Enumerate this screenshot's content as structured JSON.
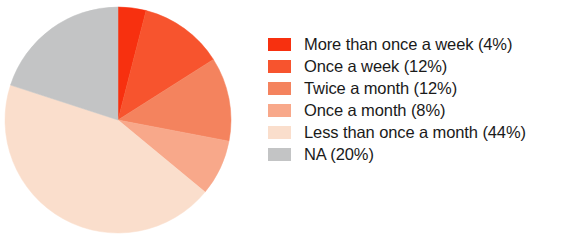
{
  "chart_data": {
    "type": "pie",
    "title": "",
    "subtitle": "",
    "xlabel": "",
    "ylabel": "",
    "legend_position": "right",
    "grid": false,
    "start_angle_deg": 0,
    "direction": "clockwise",
    "categories": [
      "More than once a week",
      "Once a week",
      "Twice a month",
      "Once a month",
      "Less than once a month",
      "NA"
    ],
    "values": [
      4,
      12,
      12,
      8,
      44,
      20
    ],
    "value_unit": "%",
    "colors": [
      "#F7300F",
      "#F7542E",
      "#F4835E",
      "#F8A88A",
      "#FADECC",
      "#C3C4C5"
    ],
    "labels": [
      "More than once a week (4%)",
      "Once a week (12%)",
      "Twice a month (12%)",
      "Once a month (8%)",
      "Less than once a month (44%)",
      "NA (20%)"
    ],
    "slices": [
      {
        "label": "More than once a week (4%)",
        "name": "More than once a week",
        "value": 4,
        "color": "#F7300F"
      },
      {
        "label": "Once a week (12%)",
        "name": "Once a week",
        "value": 12,
        "color": "#F7542E"
      },
      {
        "label": "Twice a month (12%)",
        "name": "Twice a month",
        "value": 12,
        "color": "#F4835E"
      },
      {
        "label": "Once a month (8%)",
        "name": "Once a month",
        "value": 8,
        "color": "#F8A88A"
      },
      {
        "label": "Less than once a month (44%)",
        "name": "Less than once a month",
        "value": 44,
        "color": "#FADECC"
      },
      {
        "label": "NA (20%)",
        "name": "NA",
        "value": 20,
        "color": "#C3C4C5"
      }
    ]
  },
  "legend": {
    "items": [
      {
        "label": "More than once a week (4%)",
        "color": "#F7300F"
      },
      {
        "label": "Once a week (12%)",
        "color": "#F7542E"
      },
      {
        "label": "Twice a month (12%)",
        "color": "#F4835E"
      },
      {
        "label": "Once a month (8%)",
        "color": "#F8A88A"
      },
      {
        "label": "Less than once a month (44%)",
        "color": "#FADECC"
      },
      {
        "label": "NA (20%)",
        "color": "#C3C4C5"
      }
    ]
  },
  "background_color": "#FFFFFF",
  "text_color": "#1A1A1A"
}
